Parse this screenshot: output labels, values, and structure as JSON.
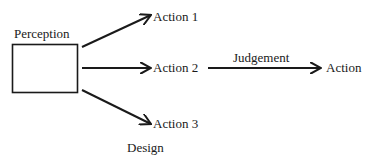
{
  "diagram": {
    "perception_label": "Perception",
    "actions": [
      "Action 1",
      "Action 2",
      "Action 3"
    ],
    "judgement_label": "Judgement",
    "final_action_label": "Action",
    "design_label": "Design",
    "colors": {
      "stroke": "#1a1a1a",
      "background": "#ffffff"
    }
  }
}
